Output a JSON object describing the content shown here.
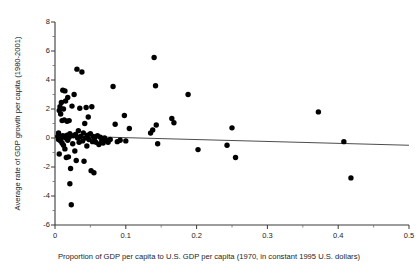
{
  "chart_data": {
    "type": "scatter",
    "title": "",
    "xlabel": "Proportion of  GDP per capita to U.S. GDP per capita (1970, in constant 1995 U.S. dollars)",
    "ylabel": "Average rate of GDP growth per capita (1980-2001)",
    "xlim": [
      0,
      0.5
    ],
    "ylim": [
      -6,
      8
    ],
    "xticks": [
      "0",
      "0.1",
      "0.2",
      "0.3",
      "0.4",
      "0.5"
    ],
    "xtick_values": [
      0,
      0.1,
      0.2,
      0.3,
      0.4,
      0.5
    ],
    "yticks": [
      "8",
      "6",
      "4",
      "2",
      "0",
      "-2",
      "-4",
      "-6"
    ],
    "ytick_values": [
      8,
      6,
      4,
      2,
      0,
      -2,
      -4,
      -6
    ],
    "minor_ytick_values": [
      7,
      5,
      3,
      1,
      -1,
      -3,
      -5
    ],
    "grid": false,
    "legend": null,
    "marker": {
      "shape": "circle",
      "color": "#000000",
      "size_px": 5.4
    },
    "trendline": {
      "type": "linear",
      "color": "#4d4d4d",
      "width_px": 1.1,
      "x_start": 0.0,
      "y_start": 0.16,
      "x_end": 0.5,
      "y_end": -0.5
    },
    "points": [
      [
        0.004,
        0.1
      ],
      [
        0.005,
        -0.1
      ],
      [
        0.005,
        0.35
      ],
      [
        0.006,
        1.9
      ],
      [
        0.006,
        -1.1
      ],
      [
        0.007,
        2.15
      ],
      [
        0.007,
        0.0
      ],
      [
        0.008,
        1.65
      ],
      [
        0.008,
        -0.2
      ],
      [
        0.009,
        2.45
      ],
      [
        0.009,
        0.05
      ],
      [
        0.01,
        1.2
      ],
      [
        0.01,
        -0.35
      ],
      [
        0.011,
        3.3
      ],
      [
        0.011,
        0.15
      ],
      [
        0.012,
        2.0
      ],
      [
        0.012,
        -0.5
      ],
      [
        0.013,
        1.25
      ],
      [
        0.013,
        0.1
      ],
      [
        0.014,
        3.25
      ],
      [
        0.014,
        -0.75
      ],
      [
        0.015,
        2.55
      ],
      [
        0.015,
        0.0
      ],
      [
        0.016,
        -1.35
      ],
      [
        0.017,
        1.15
      ],
      [
        0.017,
        0.2
      ],
      [
        0.018,
        -0.15
      ],
      [
        0.018,
        2.8
      ],
      [
        0.019,
        -1.3
      ],
      [
        0.02,
        1.2
      ],
      [
        0.02,
        0.05
      ],
      [
        0.021,
        -3.15
      ],
      [
        0.021,
        0.3
      ],
      [
        0.022,
        -2.1
      ],
      [
        0.023,
        -4.6
      ],
      [
        0.024,
        2.2
      ],
      [
        0.025,
        -0.4
      ],
      [
        0.026,
        0.15
      ],
      [
        0.027,
        3.0
      ],
      [
        0.028,
        -0.9
      ],
      [
        0.029,
        0.25
      ],
      [
        0.03,
        -1.55
      ],
      [
        0.031,
        4.75
      ],
      [
        0.032,
        0.0
      ],
      [
        0.033,
        0.5
      ],
      [
        0.034,
        -0.3
      ],
      [
        0.035,
        2.05
      ],
      [
        0.036,
        0.1
      ],
      [
        0.038,
        4.55
      ],
      [
        0.039,
        -0.2
      ],
      [
        0.04,
        0.35
      ],
      [
        0.041,
        -1.6
      ],
      [
        0.042,
        1.0
      ],
      [
        0.043,
        0.0
      ],
      [
        0.044,
        2.1
      ],
      [
        0.045,
        -0.55
      ],
      [
        0.046,
        0.2
      ],
      [
        0.047,
        1.45
      ],
      [
        0.048,
        -0.1
      ],
      [
        0.05,
        0.3
      ],
      [
        0.051,
        -2.25
      ],
      [
        0.052,
        2.15
      ],
      [
        0.053,
        -0.25
      ],
      [
        0.054,
        0.1
      ],
      [
        0.055,
        -2.4
      ],
      [
        0.056,
        0.0
      ],
      [
        0.058,
        -0.3
      ],
      [
        0.06,
        0.15
      ],
      [
        0.062,
        -0.45
      ],
      [
        0.064,
        0.05
      ],
      [
        0.066,
        -0.2
      ],
      [
        0.068,
        -0.35
      ],
      [
        0.07,
        0.0
      ],
      [
        0.072,
        -0.15
      ],
      [
        0.075,
        -0.3
      ],
      [
        0.078,
        -0.1
      ],
      [
        0.082,
        3.55
      ],
      [
        0.085,
        0.95
      ],
      [
        0.088,
        -0.25
      ],
      [
        0.092,
        -0.15
      ],
      [
        0.098,
        1.55
      ],
      [
        0.1,
        -0.2
      ],
      [
        0.105,
        0.65
      ],
      [
        0.135,
        0.35
      ],
      [
        0.138,
        0.55
      ],
      [
        0.14,
        5.55
      ],
      [
        0.142,
        3.6
      ],
      [
        0.143,
        0.9
      ],
      [
        0.145,
        -0.4
      ],
      [
        0.165,
        1.35
      ],
      [
        0.168,
        1.05
      ],
      [
        0.188,
        3.0
      ],
      [
        0.202,
        -0.8
      ],
      [
        0.243,
        -0.5
      ],
      [
        0.25,
        0.7
      ],
      [
        0.255,
        -1.35
      ],
      [
        0.372,
        1.8
      ],
      [
        0.408,
        -0.25
      ],
      [
        0.418,
        -2.75
      ]
    ]
  }
}
